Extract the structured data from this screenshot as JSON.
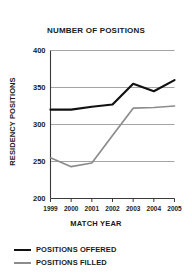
{
  "chart_data": {
    "type": "line",
    "title": "NUMBER OF POSITIONS",
    "xlabel": "MATCH YEAR",
    "ylabel": "RESIDENCY POSITIONS",
    "categories": [
      "1999",
      "2000",
      "2001",
      "2002",
      "2003",
      "2004",
      "2005"
    ],
    "x": [
      1999,
      2000,
      2001,
      2002,
      2003,
      2004,
      2005
    ],
    "ylim": [
      200,
      400
    ],
    "yticks": [
      400,
      350,
      300,
      250,
      200
    ],
    "ytick_labels": [
      "400",
      "350",
      "300",
      "250",
      "200"
    ],
    "xtick_labels": [
      "1999",
      "2000",
      "2001",
      "2002",
      "2003",
      "2004",
      "2005"
    ],
    "grid": true,
    "grid_axis": "y",
    "legend_position": "below-left",
    "series": [
      {
        "name": "POSITIONS OFFERED",
        "color": "#111111",
        "values": [
          320,
          320,
          324,
          327,
          355,
          345,
          360
        ]
      },
      {
        "name": "POSITIONS FILLED",
        "color": "#8c8c8c",
        "values": [
          255,
          243,
          248,
          285,
          322,
          323,
          325
        ]
      }
    ]
  },
  "legend": {
    "items": [
      {
        "label": "POSITIONS OFFERED",
        "swatch": "black-line-swatch"
      },
      {
        "label": "POSITIONS FILLED",
        "swatch": "gray-line-swatch"
      }
    ]
  },
  "colors": {
    "offered": "#111111",
    "filled": "#8c8c8c",
    "grid": "#9a9a9a",
    "axis": "#3a3a3a",
    "text": "#1a1a1a",
    "background": "#ffffff"
  }
}
